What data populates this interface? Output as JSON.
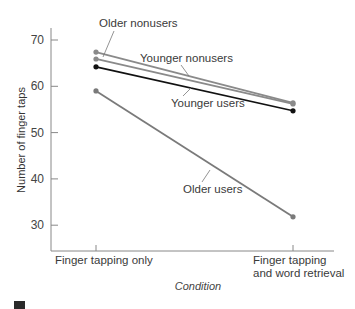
{
  "chart_data": {
    "type": "line",
    "title": "",
    "xlabel": "Condition",
    "ylabel": "Number of finger taps",
    "categories": [
      "Finger tapping only",
      "Finger tapping and word retrieval"
    ],
    "category_lines": [
      [
        "Finger tapping only"
      ],
      [
        "Finger tapping",
        "and word retrieval"
      ]
    ],
    "yticks": [
      30,
      40,
      50,
      60,
      70
    ],
    "ylim": [
      25.5,
      72
    ],
    "grid": false,
    "legend": "inline labels with leader lines",
    "series": [
      {
        "name": "Older nonusers",
        "values": [
          67.4,
          56.4
        ],
        "color": "#8a8a8a"
      },
      {
        "name": "Younger nonusers",
        "values": [
          65.9,
          56.2
        ],
        "color": "#8a8a8a"
      },
      {
        "name": "Younger users",
        "values": [
          64.2,
          54.7
        ],
        "color": "#111111"
      },
      {
        "name": "Older users",
        "values": [
          59.0,
          31.8
        ],
        "color": "#7a7a7a"
      }
    ]
  }
}
